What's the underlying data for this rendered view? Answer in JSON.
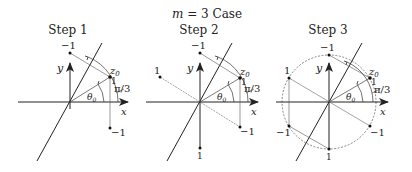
{
  "title": "m = 3 Case",
  "title_parts": {
    "var": "m",
    "rest": " = 3 Case"
  },
  "panels": [
    {
      "step_label": "Step 1",
      "origin": [
        70,
        102
      ],
      "points": [
        {
          "label": "z0",
          "value": "1",
          "pos": [
            110,
            77
          ]
        },
        {
          "label": "-1",
          "pos": [
            70,
            53
          ]
        },
        {
          "label": "-1",
          "pos": [
            110,
            128
          ]
        }
      ]
    },
    {
      "step_label": "Step 2",
      "origin": [
        200,
        102
      ],
      "points": [
        {
          "label": "z0",
          "value": "1",
          "pos": [
            240,
            78
          ]
        },
        {
          "label": "-1",
          "pos": [
            200,
            53
          ]
        },
        {
          "label": "1",
          "pos": [
            160,
            77
          ]
        },
        {
          "label": "-1",
          "pos": [
            240,
            127
          ]
        },
        {
          "label": "1",
          "pos": [
            200,
            148
          ]
        }
      ]
    },
    {
      "step_label": "Step 3",
      "origin": [
        329,
        102
      ],
      "circle_radius": 48,
      "points": [
        {
          "label": "z0",
          "value": "1",
          "pos": [
            370,
            78
          ]
        },
        {
          "label": "-1",
          "pos": [
            329,
            55
          ]
        },
        {
          "label": "1",
          "pos": [
            289,
            78
          ]
        },
        {
          "label": "-1",
          "pos": [
            289,
            126
          ]
        },
        {
          "label": "1",
          "pos": [
            329,
            149
          ]
        },
        {
          "label": "-1",
          "pos": [
            370,
            126
          ]
        }
      ]
    }
  ],
  "axis_labels": {
    "x": "x",
    "y": "y"
  },
  "angle_labels": {
    "theta": "θ0",
    "theta_sym": "θ",
    "theta_sub": "0",
    "pi3": "π/3"
  },
  "point_labels": {
    "z": "z",
    "z_sub": "0",
    "one": "1",
    "neg_one": "−1"
  }
}
